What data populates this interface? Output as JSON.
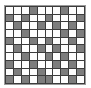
{
  "figure": {
    "type": "pattern-swatch",
    "rows": 10,
    "columns": 10,
    "colors": {
      "light_cell": "#fdfdfd",
      "dark_cell": "#7d7d7d",
      "gridline": "#3c3c3c",
      "frame_border": "#9a9a9a",
      "background": "#ffffff"
    },
    "legend": {
      "light_label": "light",
      "dark_label": "dark"
    },
    "matrix": [
      [
        0,
        0,
        0,
        1,
        0,
        0,
        0,
        1,
        0,
        0
      ],
      [
        1,
        0,
        1,
        0,
        0,
        1,
        0,
        0,
        0,
        1
      ],
      [
        0,
        1,
        0,
        0,
        1,
        0,
        1,
        0,
        1,
        0
      ],
      [
        0,
        0,
        1,
        0,
        0,
        0,
        0,
        1,
        0,
        1
      ],
      [
        1,
        0,
        0,
        1,
        0,
        1,
        0,
        0,
        1,
        0
      ],
      [
        0,
        1,
        0,
        0,
        1,
        0,
        1,
        0,
        0,
        1
      ],
      [
        0,
        0,
        1,
        0,
        0,
        1,
        0,
        1,
        0,
        0
      ],
      [
        1,
        0,
        0,
        1,
        0,
        0,
        1,
        0,
        1,
        0
      ],
      [
        0,
        1,
        0,
        0,
        1,
        0,
        0,
        1,
        0,
        1
      ],
      [
        1,
        0,
        1,
        0,
        1,
        1,
        0,
        0,
        1,
        0
      ]
    ]
  }
}
